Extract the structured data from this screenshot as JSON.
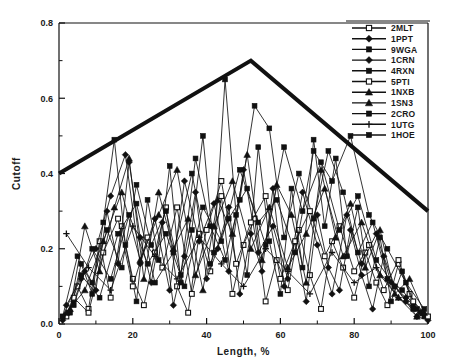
{
  "figure": {
    "background_color": "#ffffff",
    "ink_color": "#111111"
  },
  "chart_data": {
    "type": "line",
    "title": "",
    "xlabel": "Length,  %",
    "ylabel": "Cutoff",
    "xlim": [
      0,
      100
    ],
    "ylim": [
      0,
      0.8
    ],
    "xticks": [
      0,
      20,
      40,
      60,
      80,
      100
    ],
    "xtick_labels": [
      "0",
      "20",
      "40",
      "60",
      "80",
      "100"
    ],
    "yticks": [
      0.0,
      0.2,
      0.4,
      0.6,
      0.8
    ],
    "ytick_labels": [
      "0.0",
      "0.2",
      "0.4",
      "0.6",
      "0.8"
    ],
    "minor_ticks": true,
    "grid": false,
    "legend_position": "upper-right",
    "envelope": {
      "name": "cutoff-envelope",
      "style": "thick-solid",
      "line_width": 4,
      "color": "#111111",
      "points": [
        [
          0,
          0.4
        ],
        [
          52,
          0.7
        ],
        [
          100,
          0.3
        ]
      ]
    },
    "series": [
      {
        "name": "2MLT",
        "marker": "open-square",
        "color": "#111111",
        "x": [
          2,
          5,
          8,
          11,
          14,
          17,
          20,
          23,
          26,
          29,
          32,
          35,
          38,
          41,
          44,
          47,
          50,
          53,
          56,
          59,
          62,
          65,
          68,
          71,
          74,
          77,
          80,
          83,
          86,
          89,
          92,
          95,
          98
        ],
        "y": [
          0.02,
          0.1,
          0.04,
          0.22,
          0.07,
          0.26,
          0.12,
          0.05,
          0.19,
          0.31,
          0.1,
          0.03,
          0.24,
          0.14,
          0.34,
          0.08,
          0.21,
          0.28,
          0.06,
          0.17,
          0.09,
          0.25,
          0.13,
          0.04,
          0.22,
          0.15,
          0.07,
          0.19,
          0.11,
          0.05,
          0.16,
          0.08,
          0.03
        ]
      },
      {
        "name": "1PPT",
        "marker": "filled-diamond",
        "color": "#111111",
        "x": [
          1,
          4,
          7,
          10,
          13,
          16,
          19,
          22,
          25,
          28,
          31,
          34,
          37,
          40,
          43,
          46,
          49,
          52,
          55,
          58,
          61,
          64,
          67,
          70,
          73,
          76,
          79,
          82,
          85,
          88,
          91,
          94,
          97,
          100
        ],
        "y": [
          0.01,
          0.06,
          0.14,
          0.09,
          0.3,
          0.16,
          0.43,
          0.23,
          0.11,
          0.27,
          0.05,
          0.18,
          0.35,
          0.12,
          0.2,
          0.31,
          0.08,
          0.24,
          0.14,
          0.36,
          0.1,
          0.22,
          0.06,
          0.29,
          0.15,
          0.09,
          0.25,
          0.13,
          0.04,
          0.18,
          0.1,
          0.06,
          0.02,
          0.01
        ]
      },
      {
        "name": "9WGA",
        "marker": "filled-square",
        "color": "#111111",
        "x": [
          3,
          6,
          9,
          12,
          15,
          18,
          21,
          24,
          27,
          30,
          33,
          36,
          39,
          42,
          45,
          48,
          51,
          54,
          57,
          60,
          63,
          66,
          69,
          72,
          75,
          78,
          81,
          84,
          87,
          90,
          93,
          96,
          99
        ],
        "y": [
          0.03,
          0.16,
          0.08,
          0.27,
          0.49,
          0.21,
          0.06,
          0.33,
          0.17,
          0.42,
          0.11,
          0.25,
          0.5,
          0.19,
          0.65,
          0.29,
          0.13,
          0.47,
          0.22,
          0.08,
          0.36,
          0.15,
          0.49,
          0.26,
          0.44,
          0.18,
          0.31,
          0.1,
          0.23,
          0.06,
          0.14,
          0.05,
          0.02
        ]
      },
      {
        "name": "1CRN",
        "marker": "filled-diamond",
        "color": "#111111",
        "x": [
          2,
          6,
          10,
          14,
          18,
          22,
          26,
          30,
          34,
          38,
          42,
          46,
          50,
          54,
          58,
          62,
          66,
          70,
          74,
          78,
          82,
          86,
          90,
          94,
          98
        ],
        "y": [
          0.05,
          0.12,
          0.2,
          0.34,
          0.45,
          0.16,
          0.28,
          0.09,
          0.38,
          0.22,
          0.32,
          0.14,
          0.41,
          0.19,
          0.26,
          0.12,
          0.35,
          0.21,
          0.08,
          0.29,
          0.16,
          0.24,
          0.11,
          0.07,
          0.03
        ]
      },
      {
        "name": "4RXN",
        "marker": "filled-square",
        "color": "#111111",
        "x": [
          1,
          5,
          9,
          13,
          17,
          21,
          25,
          29,
          33,
          37,
          41,
          45,
          49,
          53,
          57,
          61,
          65,
          69,
          73,
          77,
          81,
          85,
          89,
          93,
          97
        ],
        "y": [
          0.02,
          0.18,
          0.11,
          0.25,
          0.15,
          0.37,
          0.21,
          0.3,
          0.13,
          0.44,
          0.26,
          0.17,
          0.33,
          0.58,
          0.52,
          0.23,
          0.4,
          0.28,
          0.46,
          0.35,
          0.19,
          0.27,
          0.12,
          0.09,
          0.04
        ]
      },
      {
        "name": "5PTI",
        "marker": "open-square",
        "color": "#111111",
        "x": [
          4,
          8,
          12,
          16,
          20,
          24,
          28,
          32,
          36,
          40,
          44,
          48,
          52,
          56,
          60,
          64,
          68,
          72,
          76,
          80,
          84,
          88,
          92,
          96,
          100
        ],
        "y": [
          0.07,
          0.03,
          0.19,
          0.28,
          0.1,
          0.23,
          0.15,
          0.31,
          0.08,
          0.25,
          0.38,
          0.16,
          0.27,
          0.34,
          0.12,
          0.22,
          0.3,
          0.18,
          0.26,
          0.14,
          0.21,
          0.09,
          0.17,
          0.06,
          0.02
        ]
      },
      {
        "name": "1NXB",
        "marker": "filled-triangle",
        "color": "#111111",
        "x": [
          3,
          7,
          11,
          15,
          19,
          23,
          27,
          31,
          35,
          39,
          43,
          47,
          51,
          55,
          59,
          63,
          67,
          71,
          75,
          79,
          83,
          87,
          91,
          95,
          99
        ],
        "y": [
          0.04,
          0.26,
          0.14,
          0.31,
          0.44,
          0.12,
          0.35,
          0.2,
          0.28,
          0.09,
          0.33,
          0.24,
          0.45,
          0.17,
          0.37,
          0.29,
          0.11,
          0.41,
          0.23,
          0.32,
          0.15,
          0.25,
          0.08,
          0.12,
          0.03
        ]
      },
      {
        "name": "1SN3",
        "marker": "filled-triangle",
        "color": "#111111",
        "x": [
          2,
          7,
          12,
          17,
          22,
          27,
          32,
          37,
          42,
          47,
          52,
          57,
          62,
          67,
          72,
          77,
          82,
          87,
          92,
          97
        ],
        "y": [
          0.03,
          0.09,
          0.22,
          0.35,
          0.17,
          0.29,
          0.41,
          0.13,
          0.26,
          0.38,
          0.2,
          0.31,
          0.15,
          0.24,
          0.36,
          0.18,
          0.27,
          0.13,
          0.07,
          0.02
        ]
      },
      {
        "name": "2CRO",
        "marker": "filled-square",
        "color": "#111111",
        "x": [
          1,
          6,
          11,
          16,
          21,
          26,
          31,
          36,
          41,
          46,
          51,
          56,
          61,
          66,
          71,
          76,
          81,
          86,
          91,
          96
        ],
        "y": [
          0.02,
          0.13,
          0.07,
          0.24,
          0.32,
          0.11,
          0.19,
          0.4,
          0.16,
          0.28,
          0.36,
          0.21,
          0.47,
          0.3,
          0.43,
          0.25,
          0.34,
          0.17,
          0.1,
          0.04
        ]
      },
      {
        "name": "1UTG",
        "marker": "plus",
        "color": "#111111",
        "x": [
          2,
          8,
          14,
          20,
          26,
          32,
          38,
          44,
          50,
          56,
          62,
          68,
          74,
          80,
          86,
          92,
          98
        ],
        "y": [
          0.24,
          0.15,
          0.09,
          0.26,
          0.18,
          0.12,
          0.23,
          0.16,
          0.1,
          0.2,
          0.14,
          0.08,
          0.19,
          0.11,
          0.15,
          0.07,
          0.03
        ]
      },
      {
        "name": "1HOE",
        "marker": "filled-square",
        "color": "#111111",
        "x": [
          4,
          9,
          14,
          19,
          24,
          29,
          34,
          39,
          44,
          49,
          54,
          59,
          64,
          69,
          74,
          79,
          84,
          89,
          94,
          99
        ],
        "y": [
          0.05,
          0.2,
          0.12,
          0.29,
          0.16,
          0.24,
          0.1,
          0.31,
          0.22,
          0.41,
          0.27,
          0.33,
          0.19,
          0.46,
          0.38,
          0.5,
          0.29,
          0.2,
          0.11,
          0.04
        ]
      }
    ]
  }
}
